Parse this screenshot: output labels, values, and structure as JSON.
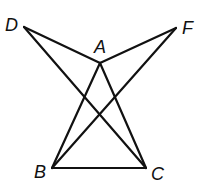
{
  "diagram": {
    "type": "geometry-figure",
    "stroke_color": "#111111",
    "background": "#ffffff",
    "points": {
      "A": {
        "label": "A",
        "x": 100,
        "y": 63
      },
      "B": {
        "label": "B",
        "x": 52,
        "y": 168
      },
      "C": {
        "label": "C",
        "x": 146,
        "y": 168
      },
      "D": {
        "label": "D",
        "x": 24,
        "y": 27
      },
      "F": {
        "label": "F",
        "x": 176,
        "y": 28
      }
    },
    "segments": [
      [
        "D",
        "A"
      ],
      [
        "A",
        "F"
      ],
      [
        "D",
        "C"
      ],
      [
        "F",
        "B"
      ],
      [
        "A",
        "B"
      ],
      [
        "A",
        "C"
      ],
      [
        "B",
        "C"
      ]
    ],
    "labels": {
      "A": "A",
      "B": "B",
      "C": "C",
      "D": "D",
      "F": "F"
    }
  }
}
